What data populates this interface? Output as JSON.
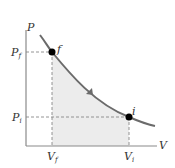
{
  "diagram": {
    "type": "PV diagram (isothermal compression)",
    "axes": {
      "x_label": "V",
      "y_label": "P"
    },
    "points": [
      {
        "name": "f",
        "label": "f",
        "pressure_label": "P",
        "pressure_sub": "f",
        "volume_label": "V",
        "volume_sub": "f"
      },
      {
        "name": "i",
        "label": "i",
        "pressure_label": "P",
        "pressure_sub": "i",
        "volume_label": "V",
        "volume_sub": "i"
      }
    ],
    "process_direction": "from i to f",
    "colors": {
      "curve": "#6b6b6b",
      "fill": "#ececec",
      "axis": "#8a8a8a",
      "point": "#000000"
    }
  }
}
